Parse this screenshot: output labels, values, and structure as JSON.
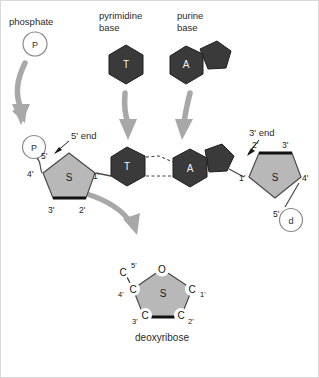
{
  "figure": {
    "title_labels": {
      "phosphate": "phosphate",
      "pyrimidine_base_line1": "pyrimidine",
      "pyrimidine_base_line2": "base",
      "purine_base_line1": "purine",
      "purine_base_line2": "base"
    },
    "end_labels": {
      "five_prime_end": "5' end",
      "three_prime_end": "3' end"
    },
    "caption": "deoxyribose",
    "colors": {
      "base_fill": "#3a3a3a",
      "base_stroke": "#1f1f1f",
      "sugar_fill": "#b8b8b8",
      "sugar_stroke": "#4a4a4a",
      "sugar_bold_edge": "#111111",
      "arrow_fill": "#a8a8a8",
      "circle_stroke": "#8a8a8a",
      "circle_fill": "#fdfdfd",
      "text": "#2b2b2b",
      "background": "#ffffff",
      "frame": "#d9d9d9"
    },
    "top_groups": [
      {
        "name": "phosphate-group",
        "circle_label": "P"
      },
      {
        "name": "pyrimidine-group",
        "base_label": "T",
        "shape": "hexagon"
      },
      {
        "name": "purine-group",
        "base_label": "A",
        "shape": "hexagon-fused-pentagon"
      }
    ],
    "nucleotide_left": {
      "phosphate_label": "P",
      "sugar_center": "S",
      "base_label": "T",
      "carbon_labels": [
        "5'",
        "4'",
        "3'",
        "2'",
        "1'"
      ]
    },
    "nucleotide_right": {
      "phosphate_label": "d",
      "sugar_center": "S",
      "base_label": "A",
      "carbon_labels": [
        "2'",
        "3'",
        "4'",
        "5'",
        "1'"
      ]
    },
    "hydrogen_bonds": {
      "count": 2,
      "style": "dashed",
      "between": [
        "T",
        "A"
      ]
    },
    "deoxyribose_detail": {
      "center_label": "S",
      "oxygen_label": "O",
      "carbons": [
        {
          "atom": "C",
          "prime": "5'"
        },
        {
          "atom": "C",
          "prime": "4'"
        },
        {
          "atom": "C",
          "prime": "3'"
        },
        {
          "atom": "C",
          "prime": "2'"
        },
        {
          "atom": "C",
          "prime": "1'"
        }
      ]
    },
    "arrows": [
      {
        "name": "arrow-phosphate-down",
        "from": "phosphate",
        "to": "nucleotide-left-phosphate"
      },
      {
        "name": "arrow-pyrimidine-down",
        "from": "pyrimidine-base",
        "to": "base-t"
      },
      {
        "name": "arrow-purine-down",
        "from": "purine-base",
        "to": "base-a"
      },
      {
        "name": "arrow-sugar-to-detail",
        "from": "sugar-left",
        "to": "deoxyribose-detail"
      }
    ]
  }
}
